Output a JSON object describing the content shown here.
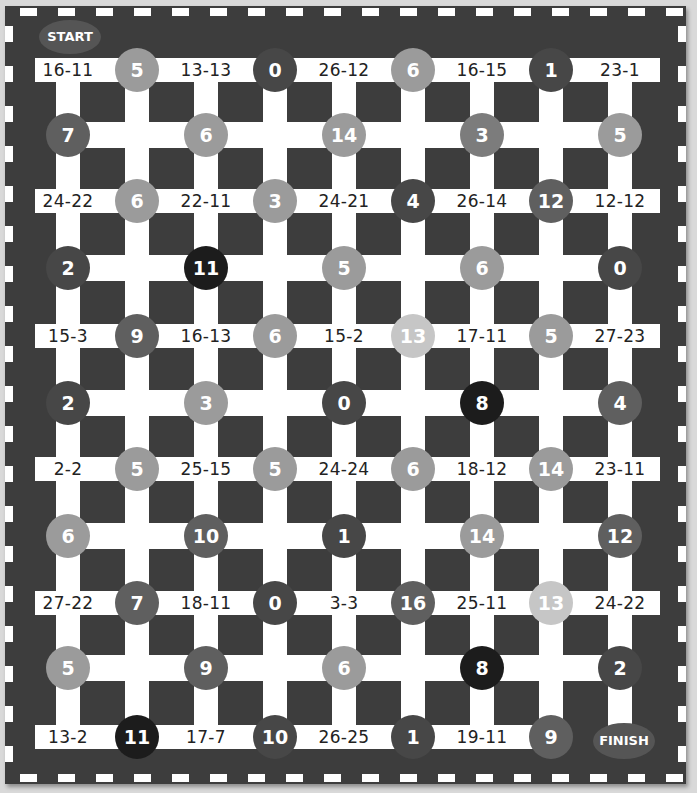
{
  "board": {
    "start_label": "START",
    "finish_label": "FINISH",
    "colors": {
      "background": "#3d3d3d",
      "path": "#ffffff",
      "badge": "#555555"
    },
    "shades": {
      "vlight": "#c6c6c6",
      "light": "#9b9b9b",
      "medium": "#7c7c7c",
      "mdark": "#5f5f5f",
      "dark": "#474747",
      "darkest": "#1c1c1c"
    },
    "equation_rows": [
      {
        "equations": [
          "16-11",
          "13-13",
          "26-12",
          "16-15",
          "23-1"
        ],
        "circles": [
          {
            "value": "5",
            "shade": "light"
          },
          {
            "value": "0",
            "shade": "dark"
          },
          {
            "value": "6",
            "shade": "light"
          },
          {
            "value": "1",
            "shade": "dark"
          }
        ]
      },
      {
        "equations": [
          "24-22",
          "22-11",
          "24-21",
          "26-14",
          "12-12"
        ],
        "circles": [
          {
            "value": "6",
            "shade": "light"
          },
          {
            "value": "3",
            "shade": "light"
          },
          {
            "value": "4",
            "shade": "dark"
          },
          {
            "value": "12",
            "shade": "mdark"
          }
        ]
      },
      {
        "equations": [
          "15-3",
          "16-13",
          "15-2",
          "17-11",
          "27-23"
        ],
        "circles": [
          {
            "value": "9",
            "shade": "mdark"
          },
          {
            "value": "6",
            "shade": "light"
          },
          {
            "value": "13",
            "shade": "vlight"
          },
          {
            "value": "5",
            "shade": "light"
          }
        ]
      },
      {
        "equations": [
          "2-2",
          "25-15",
          "24-24",
          "18-12",
          "23-11"
        ],
        "circles": [
          {
            "value": "5",
            "shade": "light"
          },
          {
            "value": "5",
            "shade": "light"
          },
          {
            "value": "6",
            "shade": "light"
          },
          {
            "value": "14",
            "shade": "light"
          }
        ]
      },
      {
        "equations": [
          "27-22",
          "18-11",
          "3-3",
          "25-11",
          "24-22"
        ],
        "circles": [
          {
            "value": "7",
            "shade": "mdark"
          },
          {
            "value": "0",
            "shade": "dark"
          },
          {
            "value": "16",
            "shade": "mdark"
          },
          {
            "value": "13",
            "shade": "vlight"
          }
        ]
      },
      {
        "equations": [
          "13-2",
          "17-7",
          "26-25",
          "19-11"
        ],
        "circles": [
          {
            "value": "11",
            "shade": "darkest"
          },
          {
            "value": "10",
            "shade": "dark"
          },
          {
            "value": "1",
            "shade": "dark"
          },
          {
            "value": "9",
            "shade": "mdark"
          }
        ]
      }
    ],
    "circle_rows": [
      [
        {
          "value": "7",
          "shade": "mdark"
        },
        {
          "value": "6",
          "shade": "light"
        },
        {
          "value": "14",
          "shade": "light"
        },
        {
          "value": "3",
          "shade": "medium"
        },
        {
          "value": "5",
          "shade": "light"
        }
      ],
      [
        {
          "value": "2",
          "shade": "dark"
        },
        {
          "value": "11",
          "shade": "darkest"
        },
        {
          "value": "5",
          "shade": "light"
        },
        {
          "value": "6",
          "shade": "light"
        },
        {
          "value": "0",
          "shade": "dark"
        }
      ],
      [
        {
          "value": "2",
          "shade": "dark"
        },
        {
          "value": "3",
          "shade": "light"
        },
        {
          "value": "0",
          "shade": "dark"
        },
        {
          "value": "8",
          "shade": "darkest"
        },
        {
          "value": "4",
          "shade": "mdark"
        }
      ],
      [
        {
          "value": "6",
          "shade": "light"
        },
        {
          "value": "10",
          "shade": "mdark"
        },
        {
          "value": "1",
          "shade": "dark"
        },
        {
          "value": "14",
          "shade": "light"
        },
        {
          "value": "12",
          "shade": "mdark"
        }
      ],
      [
        {
          "value": "5",
          "shade": "light"
        },
        {
          "value": "9",
          "shade": "mdark"
        },
        {
          "value": "6",
          "shade": "light"
        },
        {
          "value": "8",
          "shade": "darkest"
        },
        {
          "value": "2",
          "shade": "dark"
        }
      ]
    ]
  }
}
